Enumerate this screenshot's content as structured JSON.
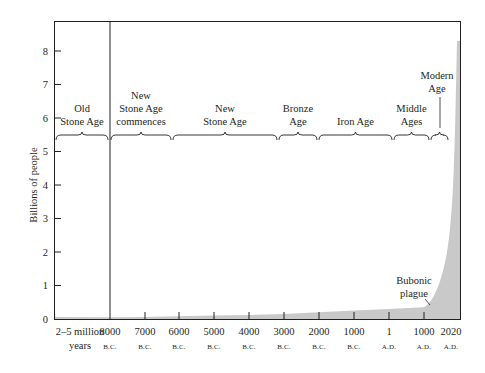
{
  "chart_data": {
    "type": "area",
    "title": "",
    "xlabel": "",
    "ylabel": "Billions of people",
    "ylim": [
      0,
      8.8
    ],
    "grid": false,
    "legend": null,
    "y_ticks": [
      "0",
      "1",
      "2",
      "3",
      "4",
      "5",
      "6",
      "7",
      "8"
    ],
    "x_ticks": [
      {
        "label": "2–5 million",
        "sub": "years",
        "px": 80
      },
      {
        "label": "8000",
        "sub": "B.C.",
        "px": 110
      },
      {
        "label": "7000",
        "sub": "B.C.",
        "px": 145
      },
      {
        "label": "6000",
        "sub": "B.C.",
        "px": 179
      },
      {
        "label": "5000",
        "sub": "B.C.",
        "px": 214
      },
      {
        "label": "4000",
        "sub": "B.C.",
        "px": 249
      },
      {
        "label": "3000",
        "sub": "B.C.",
        "px": 284
      },
      {
        "label": "2000",
        "sub": "B.C.",
        "px": 319
      },
      {
        "label": "1000",
        "sub": "B.C.",
        "px": 354
      },
      {
        "label": "1",
        "sub": "A.D.",
        "px": 389
      },
      {
        "label": "1000",
        "sub": "A.D.",
        "px": 424
      },
      {
        "label": "2020",
        "sub": "A.D.",
        "px": 451
      }
    ],
    "series": [
      {
        "name": "World population",
        "x": [
          "2–5 million years",
          "8000 B.C.",
          "7000 B.C.",
          "6000 B.C.",
          "5000 B.C.",
          "4000 B.C.",
          "3000 B.C.",
          "2000 B.C.",
          "1000 B.C.",
          "1 A.D.",
          "1000 A.D.",
          "1350 A.D.",
          "1800 A.D.",
          "1900 A.D.",
          "1950 A.D.",
          "2000 A.D.",
          "2020 A.D."
        ],
        "values": [
          0.005,
          0.05,
          0.06,
          0.08,
          0.1,
          0.12,
          0.15,
          0.2,
          0.25,
          0.3,
          0.35,
          0.4,
          0.9,
          1.6,
          2.5,
          6.1,
          8.3
        ]
      }
    ],
    "eras": [
      {
        "label": [
          "Old",
          "Stone Age"
        ],
        "x0": 55,
        "x1": 109
      },
      {
        "label": [
          "New",
          "Stone Age",
          "commences"
        ],
        "x0": 110,
        "x1": 172
      },
      {
        "label": [
          "New",
          "Stone Age"
        ],
        "x0": 172,
        "x1": 278
      },
      {
        "label": [
          "Bronze",
          "Age"
        ],
        "x0": 278,
        "x1": 318
      },
      {
        "label": [
          "Iron Age"
        ],
        "x0": 318,
        "x1": 393
      },
      {
        "label": [
          "Middle",
          "Ages"
        ],
        "x0": 393,
        "x1": 430
      },
      {
        "label": [
          "Modern",
          "Age"
        ],
        "x0": 430,
        "x1": 449
      }
    ],
    "annotations": [
      {
        "text": [
          "Bubonic",
          "plague"
        ],
        "target": "1350 A.D.",
        "value": 0.4
      }
    ],
    "colors": {
      "fill": "#c9c9c9",
      "axis": "#231f20",
      "text": "#231f20"
    }
  }
}
